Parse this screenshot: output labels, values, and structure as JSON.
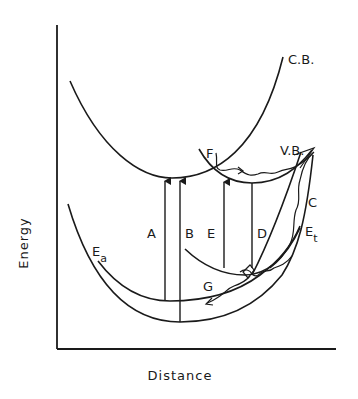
{
  "diagram": {
    "axes": {
      "y_label": "Energy",
      "x_label": "Distance"
    },
    "curve_labels": {
      "conduction_band": "C.B.",
      "valence_band": "V.B.",
      "activated_state": "E",
      "activated_state_sub": "a",
      "trap_state": "E",
      "trap_state_sub": "t"
    },
    "transition_labels": {
      "A": "A",
      "B": "B",
      "C": "C",
      "D": "D",
      "E": "E",
      "F": "F",
      "G": "G"
    },
    "colors": {
      "ink": "#1a1a1a",
      "background": "#ffffff"
    }
  }
}
